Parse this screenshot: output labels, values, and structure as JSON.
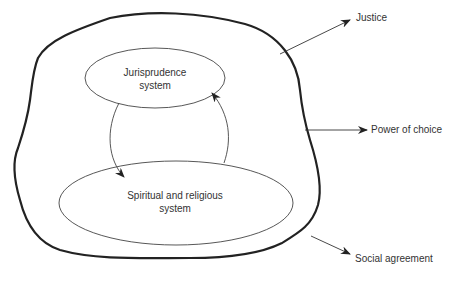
{
  "diagram": {
    "inner": {
      "top_ellipse": {
        "line1": "Jurisprudence",
        "line2": "system"
      },
      "bottom_ellipse": {
        "line1": "Spiritual and religious",
        "line2": "system"
      }
    },
    "outputs": [
      {
        "label": "Justice"
      },
      {
        "label": "Power of choice"
      },
      {
        "label": "Social agreement"
      }
    ],
    "colors": {
      "stroke": "#222222",
      "text": "#333333",
      "background": "#ffffff"
    }
  }
}
